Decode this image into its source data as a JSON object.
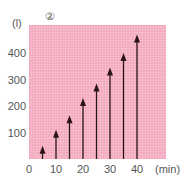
{
  "chart_data": {
    "type": "bar",
    "title": "②",
    "xlabel": "(min)",
    "ylabel": "(l)",
    "x": [
      5,
      10,
      15,
      20,
      25,
      30,
      35,
      40
    ],
    "values": [
      50,
      110,
      165,
      230,
      285,
      345,
      400,
      470
    ],
    "xticks": [
      "0",
      "10",
      "20",
      "30",
      "40"
    ],
    "yticks": [
      "100",
      "200",
      "300",
      "400"
    ],
    "xlim": [
      0,
      50
    ],
    "ylim": [
      0,
      490
    ],
    "grid": true,
    "style": "arrows",
    "colors": {
      "background": "#f4a7bd",
      "grid": "#ffffff",
      "arrow": "#2a1418"
    }
  }
}
